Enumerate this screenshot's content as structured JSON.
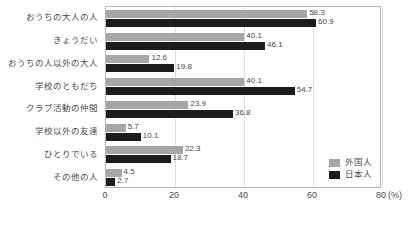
{
  "chart_data": {
    "type": "bar",
    "orientation": "horizontal",
    "title": "",
    "xlabel": "(%)",
    "ylabel": "",
    "xlim": [
      0,
      80
    ],
    "xticks": [
      "0",
      "20",
      "40",
      "60",
      "80"
    ],
    "grid": true,
    "legend_position": "bottom-right-inside",
    "categories": [
      "おうちの大人の人",
      "きょうだい",
      "おうちの人以外の大人",
      "学校のともだち",
      "クラブ活動の仲間",
      "学校以外の友達",
      "ひとりでいる",
      "その他の人"
    ],
    "series": [
      {
        "name": "外国人",
        "color": "#a6a6a6",
        "values": [
          58.3,
          40.1,
          12.6,
          40.1,
          23.9,
          5.7,
          22.3,
          4.5
        ],
        "labels": [
          "58.3",
          "40.1",
          "12.6",
          "40.1",
          "23.9",
          "5.7",
          "22.3",
          "4.5"
        ]
      },
      {
        "name": "日本人",
        "color": "#1c1c1c",
        "values": [
          60.9,
          46.1,
          19.8,
          54.7,
          36.8,
          10.1,
          18.7,
          2.7
        ],
        "labels": [
          "60.9",
          "46.1",
          "19.8",
          "54.7",
          "36.8",
          "10.1",
          "18.7",
          "2.7"
        ]
      }
    ]
  },
  "axis": {
    "unit_label": "(%)"
  },
  "legend": {
    "items": [
      {
        "label": "外国人",
        "color": "#a6a6a6"
      },
      {
        "label": "日本人",
        "color": "#1c1c1c"
      }
    ]
  }
}
